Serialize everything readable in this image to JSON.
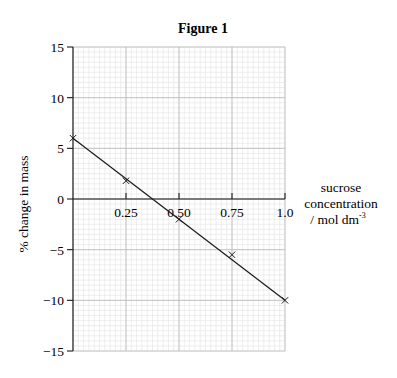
{
  "chart_data": {
    "type": "line",
    "title": "Figure 1",
    "xlabel": "sucrose concentration / mol dm⁻³",
    "xlabel_lines": [
      "sucrose",
      "concentration",
      "/ mol dm"
    ],
    "xlabel_superscript": "-3",
    "ylabel": "% change in mass",
    "xlim": [
      0,
      1.0
    ],
    "ylim": [
      -15,
      15
    ],
    "x_ticks": [
      0.25,
      0.5,
      0.75,
      1.0
    ],
    "x_tick_labels": [
      "0.25",
      "0.50",
      "0.75",
      "1.0"
    ],
    "y_ticks": [
      15,
      10,
      5,
      0,
      -5,
      -10,
      -15
    ],
    "y_tick_labels": [
      "15",
      "10",
      "5",
      "0",
      "−5",
      "−10",
      "−15"
    ],
    "grid": true,
    "minor_grid": {
      "x_step": 0.025,
      "y_step": 0.5
    },
    "series": [
      {
        "name": "measured",
        "marker": "x",
        "x": [
          0,
          0.25,
          0.5,
          0.75,
          1.0
        ],
        "y": [
          6.0,
          1.8,
          -2.0,
          -5.5,
          -10.0
        ]
      }
    ],
    "line_of_best_fit": {
      "x": [
        0,
        1.0
      ],
      "y": [
        6.0,
        -10.0
      ]
    },
    "legend": null
  },
  "colors": {
    "axis": "#1a1a1a",
    "major_grid": "#bdbdbd",
    "minor_grid": "#e2e2e2",
    "line": "#1a1a1a"
  }
}
